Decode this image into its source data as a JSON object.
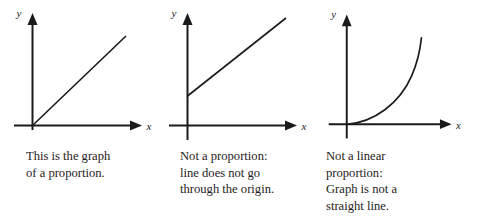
{
  "figure": {
    "background_color": "#ffffff",
    "ink_color": "#1a1a1a",
    "panel_count": 3
  },
  "panels": [
    {
      "id": "proportion",
      "axis_label_x": "x",
      "axis_label_y": "y",
      "graph_kind": "straight-line-through-origin",
      "caption_lines": [
        "This is the graph",
        "of a proportion."
      ]
    },
    {
      "id": "not-a-proportion",
      "axis_label_x": "x",
      "axis_label_y": "y",
      "graph_kind": "straight-line-with-positive-y-intercept",
      "caption_lines": [
        "Not a proportion:",
        "line does not go",
        "through the origin."
      ]
    },
    {
      "id": "not-a-linear-proportion",
      "axis_label_x": "x",
      "axis_label_y": "y",
      "graph_kind": "exponential-curve-through-origin",
      "caption_lines": [
        "Not a linear",
        "proportion:",
        "Graph is not a",
        "straight line."
      ]
    }
  ]
}
